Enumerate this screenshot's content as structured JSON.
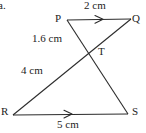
{
  "figure": {
    "type": "geometry-diagram",
    "item_marker": "a.",
    "stroke_color": "#2b2b2b",
    "text_color": "#232323",
    "background_color": "#ffffff",
    "vertices": [
      {
        "name": "P",
        "label": "P",
        "x": 67,
        "y": 20
      },
      {
        "name": "Q",
        "label": "Q",
        "x": 131,
        "y": 19
      },
      {
        "name": "T",
        "label": "T",
        "x": 93,
        "y": 51
      },
      {
        "name": "R",
        "label": "R",
        "x": 13,
        "y": 115
      },
      {
        "name": "S",
        "label": "S",
        "x": 128,
        "y": 114
      }
    ],
    "segments": [
      {
        "name": "PQ",
        "from": "P",
        "to": "Q",
        "has_arrow_marker": true,
        "length_label": "2 cm"
      },
      {
        "name": "RS",
        "from": "R",
        "to": "S",
        "has_arrow_marker": true,
        "length_label": "5 cm"
      },
      {
        "name": "PS",
        "from": "P",
        "to": "S",
        "has_arrow_marker": false,
        "length_label": ""
      },
      {
        "name": "QR",
        "from": "Q",
        "to": "R",
        "has_arrow_marker": false,
        "length_label": ""
      }
    ],
    "measure_labels": [
      {
        "name": "pq-length",
        "text": "2 cm",
        "for_segment": "PQ"
      },
      {
        "name": "pt-length",
        "text": "1.6 cm",
        "for_segment": "PT"
      },
      {
        "name": "tr-length",
        "text": "4 cm",
        "for_segment": "TR"
      },
      {
        "name": "rs-length",
        "text": "5 cm",
        "for_segment": "RS"
      }
    ]
  }
}
